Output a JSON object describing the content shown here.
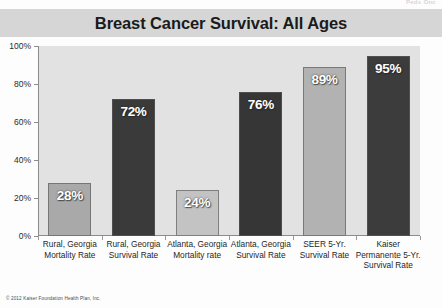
{
  "slide": {
    "top_clipped_text": "Peds Onc",
    "copyright": "© 2012 Kaiser Foundation Health Plan, Inc."
  },
  "chart_data": {
    "type": "bar",
    "title": "Breast Cancer Survival: All Ages",
    "subtitle": "",
    "xlabel": "",
    "ylabel": "",
    "ylim": [
      0,
      100
    ],
    "grid": false,
    "legend": "none",
    "ytick_labels": [
      "0%",
      "20%",
      "40%",
      "60%",
      "80%",
      "100%"
    ],
    "ytick_values": [
      0,
      20,
      40,
      60,
      80,
      100
    ],
    "categories": [
      "Rural, Georgia Mortality Rate",
      "Rural, Georgia Survival Rate",
      "Atlanta, Georgia Mortality rate",
      "Atlanta, Georgia Survival Rate",
      "SEER 5-Yr. Survival Rate",
      "Kaiser Permanente 5-Yr. Survival Rate"
    ],
    "values": [
      28,
      72,
      24,
      76,
      89,
      95
    ],
    "data_labels": [
      "28%",
      "72%",
      "24%",
      "76%",
      "89%",
      "95%"
    ],
    "bar_colors": [
      "#a9a9a9",
      "#3a3a3a",
      "#c3c3c3",
      "#363636",
      "#b2b2b2",
      "#3c3c3c"
    ],
    "plot_background": "#e2e2e2",
    "title_banner_color": "#d6d6d6"
  }
}
